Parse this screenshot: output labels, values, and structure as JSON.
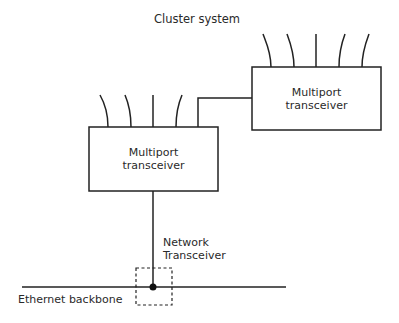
{
  "diagram": {
    "title": "Cluster system",
    "nodes": [
      {
        "id": "multiport-right",
        "line1": "Multiport",
        "line2": "transceiver"
      },
      {
        "id": "multiport-left",
        "line1": "Multiport",
        "line2": "transceiver"
      },
      {
        "id": "network-transceiver",
        "line1": "Network",
        "line2": "Transceiver"
      }
    ],
    "backbone_label": "Ethernet backbone",
    "colors": {
      "line": "#222222",
      "background": "#ffffff"
    }
  }
}
